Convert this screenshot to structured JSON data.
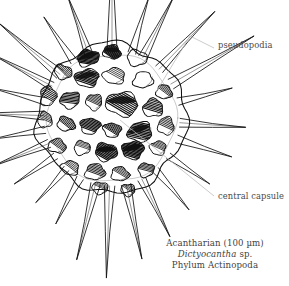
{
  "figure": {
    "organism": "acantharian-radiolarian-skeleton",
    "background_color": "#ffffff",
    "ink_color": "#101010",
    "leader_color": "#b9b9b9",
    "text_color": "#4a4a4a"
  },
  "labels": {
    "pseudopodia": "pseudopodia",
    "central_capsule": "central capsule"
  },
  "caption": {
    "line1": "Acantharian (100 µm)",
    "line2_genus": "Dictyocantha",
    "line2_species": "sp.",
    "line3": "Phylum Actinopoda"
  },
  "chart_data": {
    "type": "scatter",
    "title": "Acantharian (100 µm)",
    "sphere": {
      "cx": 112,
      "cy": 118,
      "r": 74
    },
    "spines": [
      {
        "angle": -90,
        "length": 104,
        "width": 5.0
      },
      {
        "angle": -73,
        "length": 52,
        "width": 4.0
      },
      {
        "angle": -63,
        "length": 62,
        "width": 4.5
      },
      {
        "angle": -110,
        "length": 56,
        "width": 4.2
      },
      {
        "angle": -124,
        "length": 48,
        "width": 3.6
      },
      {
        "angle": -140,
        "length": 74,
        "width": 5.0
      },
      {
        "angle": -152,
        "length": 62,
        "width": 4.2
      },
      {
        "angle": -166,
        "length": 50,
        "width": 3.8
      },
      {
        "angle": -178,
        "length": 62,
        "width": 4.4
      },
      {
        "angle": 170,
        "length": 48,
        "width": 3.6
      },
      {
        "angle": 158,
        "length": 56,
        "width": 4.2
      },
      {
        "angle": 146,
        "length": 44,
        "width": 3.4
      },
      {
        "angle": 132,
        "length": 40,
        "width": 3.2
      },
      {
        "angle": 118,
        "length": 46,
        "width": 3.6
      },
      {
        "angle": 104,
        "length": 72,
        "width": 4.8
      },
      {
        "angle": 92,
        "length": 86,
        "width": 5.2
      },
      {
        "angle": 78,
        "length": 70,
        "width": 4.8
      },
      {
        "angle": 64,
        "length": 58,
        "width": 4.2
      },
      {
        "angle": 50,
        "length": 46,
        "width": 3.6
      },
      {
        "angle": 34,
        "length": 44,
        "width": 3.4
      },
      {
        "angle": 18,
        "length": 52,
        "width": 4.0
      },
      {
        "angle": 4,
        "length": 60,
        "width": 4.4
      },
      {
        "angle": -14,
        "length": 50,
        "width": 3.8
      },
      {
        "angle": -30,
        "length": 90,
        "width": 5.4
      },
      {
        "angle": -46,
        "length": 74,
        "width": 4.8
      }
    ],
    "pores": [
      {
        "x": 112,
        "y": 52,
        "rx": 9,
        "ry": 7,
        "shade": 0.85,
        "rot": 10
      },
      {
        "x": 88,
        "y": 58,
        "rx": 11,
        "ry": 8,
        "shade": 0.9,
        "rot": -15
      },
      {
        "x": 137,
        "y": 58,
        "rx": 10,
        "ry": 8,
        "shade": 0.1,
        "rot": 8
      },
      {
        "x": 63,
        "y": 72,
        "rx": 9,
        "ry": 7,
        "shade": 0.35,
        "rot": 20
      },
      {
        "x": 87,
        "y": 78,
        "rx": 12,
        "ry": 9,
        "shade": 0.8,
        "rot": -6
      },
      {
        "x": 114,
        "y": 76,
        "rx": 11,
        "ry": 8,
        "shade": 0.25,
        "rot": 4
      },
      {
        "x": 143,
        "y": 80,
        "rx": 10,
        "ry": 8,
        "shade": 0.15,
        "rot": -10
      },
      {
        "x": 164,
        "y": 92,
        "rx": 8,
        "ry": 7,
        "shade": 0.3,
        "rot": 12
      },
      {
        "x": 48,
        "y": 96,
        "rx": 8,
        "ry": 10,
        "shade": 0.5,
        "rot": 5
      },
      {
        "x": 70,
        "y": 100,
        "rx": 10,
        "ry": 8,
        "shade": 0.6,
        "rot": -18
      },
      {
        "x": 94,
        "y": 102,
        "rx": 8,
        "ry": 8,
        "shade": 0.4,
        "rot": 0
      },
      {
        "x": 122,
        "y": 104,
        "rx": 16,
        "ry": 12,
        "shade": 0.75,
        "rot": 6
      },
      {
        "x": 153,
        "y": 108,
        "rx": 10,
        "ry": 9,
        "shade": 0.55,
        "rot": -8
      },
      {
        "x": 45,
        "y": 120,
        "rx": 7,
        "ry": 8,
        "shade": 0.3,
        "rot": 0
      },
      {
        "x": 66,
        "y": 124,
        "rx": 9,
        "ry": 7,
        "shade": 0.45,
        "rot": 14
      },
      {
        "x": 90,
        "y": 126,
        "rx": 10,
        "ry": 8,
        "shade": 0.7,
        "rot": -4
      },
      {
        "x": 112,
        "y": 130,
        "rx": 9,
        "ry": 7,
        "shade": 0.5,
        "rot": 8
      },
      {
        "x": 140,
        "y": 132,
        "rx": 12,
        "ry": 10,
        "shade": 0.85,
        "rot": -12
      },
      {
        "x": 166,
        "y": 126,
        "rx": 8,
        "ry": 9,
        "shade": 0.4,
        "rot": 0
      },
      {
        "x": 57,
        "y": 146,
        "rx": 9,
        "ry": 7,
        "shade": 0.35,
        "rot": 10
      },
      {
        "x": 82,
        "y": 148,
        "rx": 8,
        "ry": 7,
        "shade": 0.2,
        "rot": -6
      },
      {
        "x": 106,
        "y": 152,
        "rx": 11,
        "ry": 9,
        "shade": 0.9,
        "rot": 5
      },
      {
        "x": 133,
        "y": 150,
        "rx": 11,
        "ry": 9,
        "shade": 0.95,
        "rot": -8
      },
      {
        "x": 158,
        "y": 148,
        "rx": 8,
        "ry": 7,
        "shade": 0.3,
        "rot": 0
      },
      {
        "x": 70,
        "y": 168,
        "rx": 9,
        "ry": 7,
        "shade": 0.25,
        "rot": 12
      },
      {
        "x": 95,
        "y": 172,
        "rx": 10,
        "ry": 8,
        "shade": 0.45,
        "rot": -5
      },
      {
        "x": 120,
        "y": 174,
        "rx": 9,
        "ry": 7,
        "shade": 0.3,
        "rot": 6
      },
      {
        "x": 146,
        "y": 170,
        "rx": 8,
        "ry": 7,
        "shade": 0.35,
        "rot": -10
      },
      {
        "x": 100,
        "y": 188,
        "rx": 8,
        "ry": 6,
        "shade": 0.2,
        "rot": 0
      },
      {
        "x": 128,
        "y": 190,
        "rx": 7,
        "ry": 6,
        "shade": 0.25,
        "rot": 8
      }
    ],
    "leaders": [
      {
        "name": "pseudopodia",
        "path": "M 214 48 L 190 36 L 156 92"
      },
      {
        "name": "central_capsule",
        "path": "M 214 196 L 120 120"
      }
    ]
  }
}
